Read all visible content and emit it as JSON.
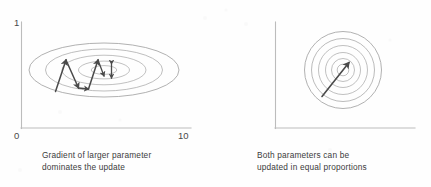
{
  "figure": {
    "background_color": "#fefefe",
    "contour_color": "#9a9a9a",
    "arrow_color": "#4a4a4a",
    "axis_color": "#b9b9b9",
    "text_color": "#3c3c3c"
  },
  "panels": [
    {
      "id": "unnormalized-parameters",
      "caption": "Gradient of larger parameter\ndominates the update",
      "axes": {
        "y_max_label": "1",
        "y_min_label": "0",
        "x_min_label": "0",
        "x_max_label": "10",
        "x_range": [
          0,
          10
        ],
        "y_range": [
          0,
          1
        ]
      },
      "contours": {
        "shape": "ellipse",
        "count": 5,
        "center": [
          4.6,
          0.54
        ],
        "semi_axes_x": [
          5.0,
          3.9,
          2.8,
          1.7,
          0.85
        ],
        "semi_axes_y": [
          0.24,
          0.185,
          0.13,
          0.078,
          0.038
        ]
      },
      "path": {
        "type": "zigzag",
        "label": "oscillating gradient descent path",
        "points": [
          [
            1.85,
            0.355
          ],
          [
            2.45,
            0.66
          ],
          [
            3.15,
            0.395
          ],
          [
            3.72,
            0.385
          ],
          [
            4.25,
            0.66
          ],
          [
            4.62,
            0.5
          ]
        ],
        "extra_arrow": {
          "label": "small-step-vertical-arrow",
          "x": 5.05,
          "y_from": 0.6,
          "y_to": 0.485,
          "double_headed": true
        }
      }
    },
    {
      "id": "normalized-parameters",
      "caption": "Both parameters can be\nupdated in equal proportions",
      "axes": {
        "y_max_label": "1",
        "y_min_label": "0",
        "x_min_label": "0",
        "x_max_label": "1",
        "x_range": [
          0,
          1
        ],
        "y_range": [
          0,
          1
        ]
      },
      "contours": {
        "shape": "circle",
        "count": 6,
        "center": [
          0.485,
          0.545
        ],
        "radii": [
          0.275,
          0.225,
          0.175,
          0.125,
          0.082,
          0.042
        ]
      },
      "path": {
        "type": "straight",
        "label": "direct gradient descent path",
        "points": [
          [
            0.335,
            0.3
          ],
          [
            0.52,
            0.605
          ]
        ]
      }
    }
  ]
}
